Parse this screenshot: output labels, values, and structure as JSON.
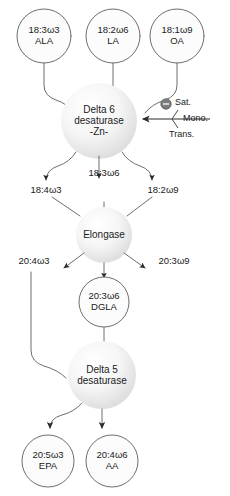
{
  "diagram": {
    "colors": {
      "stroke": "#6e6e6e",
      "arrow_fill": "#2b2b2b",
      "text": "#1a1a1a",
      "circle_fill_light": "#fbfbfb",
      "circle_fill_shaded": "#f0f0f0",
      "inhibitor_fill": "#7d7d7d"
    }
  },
  "substrates": [
    {
      "id": "ala",
      "line1": "18:3ω3",
      "line2": "ALA"
    },
    {
      "id": "la",
      "line1": "18:2ω6",
      "line2": "LA"
    },
    {
      "id": "oa",
      "line1": "18:1ω9",
      "line2": "OA"
    }
  ],
  "enzymes": [
    {
      "id": "delta6",
      "line1": "Delta 6",
      "line2": "desaturase",
      "line3": "-Zn-"
    },
    {
      "id": "elongase",
      "line1": "Elongase"
    },
    {
      "id": "delta5",
      "line1": "Delta 5",
      "line2": "desaturase"
    }
  ],
  "intermediates_d6": [
    {
      "id": "18-4w3",
      "label": "18:4ω3"
    },
    {
      "id": "18-3w6",
      "label": "18:3ω6"
    },
    {
      "id": "18-2w9",
      "label": "18:2ω9"
    }
  ],
  "intermediates_elongase": [
    {
      "id": "20-4w3",
      "label": "20:4ω3"
    },
    {
      "id": "20-3w9",
      "label": "20:3ω9"
    }
  ],
  "dgla": {
    "id": "dgla",
    "line1": "20:3ω6",
    "line2": "DGLA"
  },
  "products": [
    {
      "id": "epa",
      "line1": "20:5ω3",
      "line2": "EPA"
    },
    {
      "id": "aa",
      "line1": "20:4ω6",
      "line2": "AA"
    }
  ],
  "inhibitors": {
    "symbol": "minus-in-circle",
    "items": [
      {
        "id": "sat",
        "label": "Sat."
      },
      {
        "id": "mono",
        "label": "Mono."
      },
      {
        "id": "trans",
        "label": "Trans."
      }
    ]
  }
}
